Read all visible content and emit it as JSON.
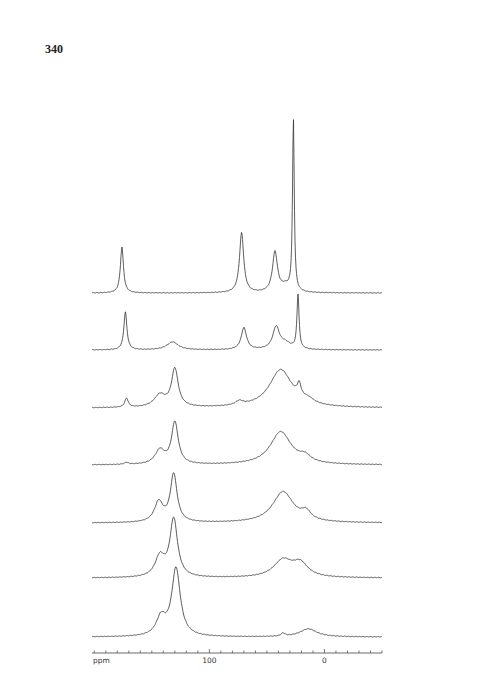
{
  "page": {
    "number": "340"
  },
  "chart_data": {
    "type": "line",
    "title": "",
    "xlabel": "ppm",
    "ylabel": "",
    "x_axis": {
      "unit": "ppm",
      "reversed": true,
      "range": [
        202,
        -50
      ],
      "major_ticks": [
        {
          "value": 100,
          "label": "100"
        },
        {
          "value": 0,
          "label": "0"
        }
      ],
      "minor_tick_step": 10
    },
    "layout": {
      "stacked": true,
      "grid": false,
      "legend": "none",
      "series_count": 7
    },
    "series": [
      {
        "name": "spectrum-1",
        "baseline_px": 293,
        "peaks": [
          {
            "ppm": 176,
            "height": 46,
            "width": 1.6
          },
          {
            "ppm": 72,
            "height": 60,
            "width": 2.2
          },
          {
            "ppm": 43,
            "height": 40,
            "width": 2.6
          },
          {
            "ppm": 34,
            "height": 6,
            "width": 5
          },
          {
            "ppm": 27,
            "height": 172,
            "width": 0.9
          }
        ]
      },
      {
        "name": "spectrum-2",
        "baseline_px": 350,
        "peaks": [
          {
            "ppm": 173,
            "height": 38,
            "width": 1.6
          },
          {
            "ppm": 132,
            "height": 8,
            "width": 6
          },
          {
            "ppm": 70,
            "height": 22,
            "width": 2.8
          },
          {
            "ppm": 42,
            "height": 22,
            "width": 3.5
          },
          {
            "ppm": 34,
            "height": 6,
            "width": 6
          },
          {
            "ppm": 23,
            "height": 54,
            "width": 1.1
          }
        ]
      },
      {
        "name": "spectrum-3",
        "baseline_px": 408,
        "peaks": [
          {
            "ppm": 172,
            "height": 9,
            "width": 1.8
          },
          {
            "ppm": 143,
            "height": 12,
            "width": 6
          },
          {
            "ppm": 130,
            "height": 38,
            "width": 3.5
          },
          {
            "ppm": 74,
            "height": 4,
            "width": 4
          },
          {
            "ppm": 38,
            "height": 38,
            "width": 12
          },
          {
            "ppm": 22,
            "height": 12,
            "width": 2
          },
          {
            "ppm": 14,
            "height": 4,
            "width": 6
          }
        ]
      },
      {
        "name": "spectrum-4",
        "baseline_px": 465,
        "peaks": [
          {
            "ppm": 172,
            "height": 2,
            "width": 2
          },
          {
            "ppm": 143,
            "height": 14,
            "width": 5
          },
          {
            "ppm": 130,
            "height": 42,
            "width": 3.5
          },
          {
            "ppm": 38,
            "height": 33,
            "width": 11
          },
          {
            "ppm": 17,
            "height": 6,
            "width": 6
          }
        ]
      },
      {
        "name": "spectrum-5",
        "baseline_px": 523,
        "peaks": [
          {
            "ppm": 144,
            "height": 20,
            "width": 4.5
          },
          {
            "ppm": 131,
            "height": 48,
            "width": 3.5
          },
          {
            "ppm": 36,
            "height": 31,
            "width": 11
          },
          {
            "ppm": 16,
            "height": 8,
            "width": 5
          }
        ]
      },
      {
        "name": "spectrum-6",
        "baseline_px": 578,
        "peaks": [
          {
            "ppm": 143,
            "height": 20,
            "width": 5
          },
          {
            "ppm": 131,
            "height": 58,
            "width": 4
          },
          {
            "ppm": 36,
            "height": 17,
            "width": 10
          },
          {
            "ppm": 21,
            "height": 13,
            "width": 8
          }
        ]
      },
      {
        "name": "spectrum-7",
        "baseline_px": 637,
        "peaks": [
          {
            "ppm": 142,
            "height": 18,
            "width": 5
          },
          {
            "ppm": 129,
            "height": 68,
            "width": 4.5
          },
          {
            "ppm": 36,
            "height": 3,
            "width": 2
          },
          {
            "ppm": 14,
            "height": 8,
            "width": 9
          }
        ]
      }
    ]
  }
}
